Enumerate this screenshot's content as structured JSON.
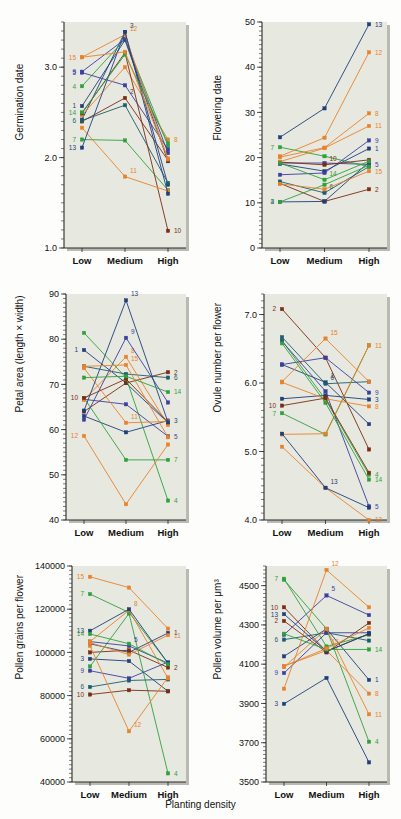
{
  "figure": {
    "xlabel": "Planting density",
    "categories": [
      "Low",
      "Medium",
      "High"
    ],
    "background_color": "#e7e8e0",
    "axis_color": "#2a2a2a"
  },
  "family_colors": {
    "1": "#1f3f7a",
    "2": "#7a2d12",
    "3": "#1f3f7a",
    "4": "#2fa13c",
    "5": "#3b3f9e",
    "6": "#1a5f6e",
    "7": "#2fa13c",
    "8": "#e8822b",
    "9": "#3b3f9e",
    "10": "#7a2d12",
    "11": "#e8822b",
    "12": "#e8822b",
    "13": "#1f3f7a",
    "14": "#2fa13c",
    "15": "#e8822b"
  },
  "chart_data": [
    {
      "id": "germination-date",
      "type": "line",
      "title": "",
      "ylabel": "Germination date",
      "xlabel": "",
      "x": [
        "Low",
        "Medium",
        "High"
      ],
      "ylim": [
        1.0,
        3.5
      ],
      "yticks": [
        1.0,
        2.0,
        3.0
      ],
      "ytick_labels": [
        "1.0",
        "2.0",
        "3.0"
      ],
      "grid": false,
      "legend": "inline-endpoint-labels",
      "series": [
        {
          "name": "1",
          "values": [
            2.57,
            3.3,
            1.96
          ],
          "label_at": "Low"
        },
        {
          "name": "2",
          "values": [
            2.4,
            2.66,
            1.97
          ],
          "label_at": "Medium"
        },
        {
          "name": "3",
          "values": [
            2.42,
            3.39,
            1.7
          ],
          "label_at": "Medium"
        },
        {
          "name": "4",
          "values": [
            2.79,
            3.31,
            2.13
          ],
          "label_at": "Low"
        },
        {
          "name": "5",
          "values": [
            2.94,
            2.8,
            2.09
          ],
          "label_at": "Low"
        },
        {
          "name": "6",
          "values": [
            2.41,
            2.58,
            1.72
          ],
          "label_at": "Low"
        },
        {
          "name": "7",
          "values": [
            2.2,
            2.19,
            1.64
          ],
          "label_at": "Low"
        },
        {
          "name": "8",
          "values": [
            2.47,
            3.0,
            2.2
          ],
          "label_at": "High"
        },
        {
          "name": "9",
          "values": [
            2.95,
            3.31,
            2.05
          ],
          "label_at": "Low"
        },
        {
          "name": "10",
          "values": [
            2.49,
            3.16,
            1.19
          ],
          "label_at": "High"
        },
        {
          "name": "11",
          "values": [
            2.33,
            1.79,
            1.63
          ],
          "label_at": "Medium"
        },
        {
          "name": "12",
          "values": [
            3.11,
            3.36,
            1.98
          ],
          "label_at": "Medium"
        },
        {
          "name": "13",
          "values": [
            2.11,
            3.39,
            1.6
          ],
          "label_at": "Low"
        },
        {
          "name": "14",
          "values": [
            2.5,
            3.14,
            2.16
          ],
          "label_at": "Low"
        },
        {
          "name": "15",
          "values": [
            3.11,
            3.17,
            1.99
          ],
          "label_at": "Low"
        }
      ]
    },
    {
      "id": "flowering-date",
      "type": "line",
      "title": "",
      "ylabel": "Flowering date",
      "xlabel": "",
      "x": [
        "Low",
        "Medium",
        "High"
      ],
      "ylim": [
        0,
        50
      ],
      "yticks": [
        0,
        10,
        20,
        30,
        40,
        50
      ],
      "ytick_labels": [
        "0",
        "10",
        "20",
        "30",
        "40",
        "50"
      ],
      "grid": false,
      "legend": "inline-endpoint-labels",
      "series": [
        {
          "name": "1",
          "values": [
            18.6,
            17.0,
            22.0
          ],
          "label_at": "High"
        },
        {
          "name": "2",
          "values": [
            14.3,
            10.3,
            13.0
          ],
          "label_at": "High"
        },
        {
          "name": "3",
          "values": [
            10.2,
            10.3,
            19.0
          ],
          "label_at": "Low"
        },
        {
          "name": "4",
          "values": [
            10.2,
            14.0,
            18.3
          ],
          "label_at": "Low"
        },
        {
          "name": "5",
          "values": [
            18.8,
            18.8,
            18.5
          ],
          "label_at": "High"
        },
        {
          "name": "6",
          "values": [
            14.7,
            12.2,
            18.0
          ],
          "label_at": "Medium"
        },
        {
          "name": "7",
          "values": [
            22.3,
            20.3,
            18.0
          ],
          "label_at": "Low"
        },
        {
          "name": "8",
          "values": [
            20.1,
            22.2,
            29.8
          ],
          "label_at": "High"
        },
        {
          "name": "9",
          "values": [
            16.2,
            16.6,
            23.8
          ],
          "label_at": "High"
        },
        {
          "name": "10",
          "values": [
            19.0,
            18.4,
            19.5
          ],
          "label_at": "Medium"
        },
        {
          "name": "11",
          "values": [
            19.1,
            22.1,
            27.0
          ],
          "label_at": "High"
        },
        {
          "name": "12",
          "values": [
            20.3,
            24.4,
            43.3
          ],
          "label_at": "High"
        },
        {
          "name": "13",
          "values": [
            24.5,
            30.9,
            49.5
          ],
          "label_at": "High"
        },
        {
          "name": "14",
          "values": [
            18.8,
            15.1,
            19.2
          ],
          "label_at": "Medium"
        },
        {
          "name": "15",
          "values": [
            14.2,
            13.0,
            17.0
          ],
          "label_at": "High"
        }
      ]
    },
    {
      "id": "petal-area",
      "type": "line",
      "title": "",
      "ylabel": "Petal area (length × width)",
      "xlabel": "",
      "x": [
        "Low",
        "Medium",
        "High"
      ],
      "ylim": [
        40,
        90
      ],
      "yticks": [
        40,
        50,
        60,
        70,
        80,
        90
      ],
      "ytick_labels": [
        "40",
        "50",
        "60",
        "70",
        "80",
        "90"
      ],
      "grid": false,
      "legend": "inline-endpoint-labels",
      "series": [
        {
          "name": "1",
          "values": [
            77.6,
            70.3,
            61.5
          ],
          "label_at": "Low"
        },
        {
          "name": "2",
          "values": [
            64.0,
            70.3,
            72.7
          ],
          "label_at": "High"
        },
        {
          "name": "3",
          "values": [
            63.0,
            59.4,
            62.0
          ],
          "label_at": "High"
        },
        {
          "name": "4",
          "values": [
            81.4,
            71.5,
            44.3
          ],
          "label_at": "High"
        },
        {
          "name": "5",
          "values": [
            66.7,
            65.6,
            58.5
          ],
          "label_at": "High"
        },
        {
          "name": "6",
          "values": [
            74.0,
            72.3,
            71.5
          ],
          "label_at": "High"
        },
        {
          "name": "7",
          "values": [
            67.0,
            53.3,
            53.3
          ],
          "label_at": "High"
        },
        {
          "name": "8",
          "values": [
            66.6,
            76.1,
            61.0
          ],
          "label_at": "Medium"
        },
        {
          "name": "9",
          "values": [
            62.2,
            80.3,
            66.0
          ],
          "label_at": "Medium"
        },
        {
          "name": "10",
          "values": [
            67.0,
            71.2,
            61.7
          ],
          "label_at": "Low"
        },
        {
          "name": "11",
          "values": [
            73.6,
            61.5,
            61.8
          ],
          "label_at": "Medium"
        },
        {
          "name": "12",
          "values": [
            58.6,
            43.5,
            56.7
          ],
          "label_at": "Low"
        },
        {
          "name": "13",
          "values": [
            64.2,
            88.6,
            61.6
          ],
          "label_at": "Medium"
        },
        {
          "name": "14",
          "values": [
            71.5,
            71.8,
            68.3
          ],
          "label_at": "High"
        },
        {
          "name": "15",
          "values": [
            74.0,
            74.3,
            58.3
          ],
          "label_at": "Medium"
        }
      ]
    },
    {
      "id": "ovule-number",
      "type": "line",
      "title": "",
      "ylabel": "Ovule number per flower",
      "xlabel": "",
      "x": [
        "Low",
        "Medium",
        "High"
      ],
      "ylim": [
        4.0,
        7.3
      ],
      "yticks": [
        4.0,
        5.0,
        6.0,
        7.0
      ],
      "ytick_labels": [
        "4.0",
        "5.0",
        "6.0",
        "7.0"
      ],
      "grid": false,
      "legend": "inline-endpoint-labels",
      "series": [
        {
          "name": "1",
          "values": [
            6.27,
            6.01,
            5.4
          ],
          "label_at": "Medium"
        },
        {
          "name": "2",
          "values": [
            7.08,
            6.37,
            5.03
          ],
          "label_at": "Low"
        },
        {
          "name": "3",
          "values": [
            5.77,
            5.82,
            5.76
          ],
          "label_at": "High"
        },
        {
          "name": "4",
          "values": [
            6.62,
            5.76,
            4.66
          ],
          "label_at": "High"
        },
        {
          "name": "5",
          "values": [
            6.61,
            5.88,
            4.2
          ],
          "label_at": "High"
        },
        {
          "name": "6",
          "values": [
            6.67,
            5.99,
            6.02
          ],
          "label_at": "Medium"
        },
        {
          "name": "7",
          "values": [
            5.56,
            5.25,
            6.55
          ],
          "label_at": "Low"
        },
        {
          "name": "8",
          "values": [
            6.01,
            5.77,
            5.66
          ],
          "label_at": "High"
        },
        {
          "name": "9",
          "values": [
            6.27,
            6.37,
            5.86
          ],
          "label_at": "High"
        },
        {
          "name": "10",
          "values": [
            5.67,
            5.78,
            4.69
          ],
          "label_at": "Low"
        },
        {
          "name": "11",
          "values": [
            5.25,
            5.26,
            6.55
          ],
          "label_at": "High"
        },
        {
          "name": "12",
          "values": [
            5.07,
            4.47,
            4.0
          ],
          "label_at": "High"
        },
        {
          "name": "13",
          "values": [
            5.26,
            4.47,
            4.18
          ],
          "label_at": "Medium"
        },
        {
          "name": "14",
          "values": [
            6.58,
            5.71,
            4.59
          ],
          "label_at": "High"
        },
        {
          "name": "15",
          "values": [
            6.02,
            6.65,
            6.02
          ],
          "label_at": "Medium"
        }
      ]
    },
    {
      "id": "pollen-grains",
      "type": "line",
      "title": "",
      "ylabel": "Pollen grains per flower",
      "xlabel": "",
      "x": [
        "Low",
        "Medium",
        "High"
      ],
      "ylim": [
        40000,
        140000
      ],
      "yticks": [
        40000,
        60000,
        80000,
        100000,
        120000,
        140000
      ],
      "ytick_labels": [
        "40000",
        "60000",
        "80000",
        "100000",
        "120000",
        "140000"
      ],
      "grid": false,
      "legend": "inline-endpoint-labels",
      "series": [
        {
          "name": "1",
          "values": [
            104000,
            100000,
            109000
          ],
          "label_at": "High"
        },
        {
          "name": "2",
          "values": [
            100000,
            101000,
            93000
          ],
          "label_at": "High"
        },
        {
          "name": "3",
          "values": [
            97000,
            96000,
            82000
          ],
          "label_at": "Low"
        },
        {
          "name": "4",
          "values": [
            93500,
            118000,
            44000
          ],
          "label_at": "High"
        },
        {
          "name": "5",
          "values": [
            105000,
            103000,
            95000
          ],
          "label_at": "Medium"
        },
        {
          "name": "6",
          "values": [
            84000,
            87000,
            87500
          ],
          "label_at": "Low"
        },
        {
          "name": "7",
          "values": [
            127000,
            118500,
            95000
          ],
          "label_at": "Low"
        },
        {
          "name": "8",
          "values": [
            105000,
            119500,
            88000
          ],
          "label_at": "Medium"
        },
        {
          "name": "9",
          "values": [
            91500,
            88000,
            95500
          ],
          "label_at": "Low"
        },
        {
          "name": "10",
          "values": [
            80500,
            82500,
            82000
          ],
          "label_at": "Low"
        },
        {
          "name": "11",
          "values": [
            104500,
            99000,
            108000
          ],
          "label_at": "High"
        },
        {
          "name": "12",
          "values": [
            103000,
            63500,
            88500
          ],
          "label_at": "Medium"
        },
        {
          "name": "13",
          "values": [
            110000,
            120000,
            95000
          ],
          "label_at": "Low"
        },
        {
          "name": "14",
          "values": [
            108500,
            104000,
            94500
          ],
          "label_at": "Low"
        },
        {
          "name": "15",
          "values": [
            135000,
            130000,
            111000
          ],
          "label_at": "Low"
        }
      ]
    },
    {
      "id": "pollen-volume",
      "type": "line",
      "title": "",
      "ylabel": "Pollen volume per μm³",
      "xlabel": "",
      "x": [
        "Low",
        "Medium",
        "High"
      ],
      "ylim": [
        3500,
        4600
      ],
      "yticks": [
        3500,
        3700,
        3900,
        4100,
        4300,
        4500
      ],
      "ytick_labels": [
        "3500",
        "3700",
        "3900",
        "4100",
        "4300",
        "4500"
      ],
      "grid": false,
      "legend": "inline-endpoint-labels",
      "series": [
        {
          "name": "1",
          "values": [
            4140,
            4280,
            4020
          ],
          "label_at": "High"
        },
        {
          "name": "2",
          "values": [
            4320,
            4160,
            4310
          ],
          "label_at": "Low"
        },
        {
          "name": "3",
          "values": [
            3898,
            4030,
            3600
          ],
          "label_at": "Low"
        },
        {
          "name": "4",
          "values": [
            4530,
            4280,
            3705
          ],
          "label_at": "High"
        },
        {
          "name": "5",
          "values": [
            4250,
            4450,
            4350
          ],
          "label_at": "Medium"
        },
        {
          "name": "6",
          "values": [
            4225,
            4260,
            4220
          ],
          "label_at": "Low"
        },
        {
          "name": "7",
          "values": [
            4535,
            4190,
            4250
          ],
          "label_at": "Low"
        },
        {
          "name": "8",
          "values": [
            4090,
            4170,
            3950
          ],
          "label_at": "High"
        },
        {
          "name": "9",
          "values": [
            4055,
            4260,
            4260
          ],
          "label_at": "Low"
        },
        {
          "name": "10",
          "values": [
            4390,
            4165,
            4255
          ],
          "label_at": "Low"
        },
        {
          "name": "11",
          "values": [
            4085,
            4280,
            3845
          ],
          "label_at": "High"
        },
        {
          "name": "12",
          "values": [
            3975,
            4580,
            4390
          ],
          "label_at": "Medium"
        },
        {
          "name": "13",
          "values": [
            4355,
            4165,
            4255
          ],
          "label_at": "Low"
        },
        {
          "name": "14",
          "values": [
            4255,
            4175,
            4175
          ],
          "label_at": "High"
        },
        {
          "name": "15",
          "values": [
            4090,
            4180,
            4285
          ],
          "label_at": "Medium"
        }
      ]
    }
  ]
}
